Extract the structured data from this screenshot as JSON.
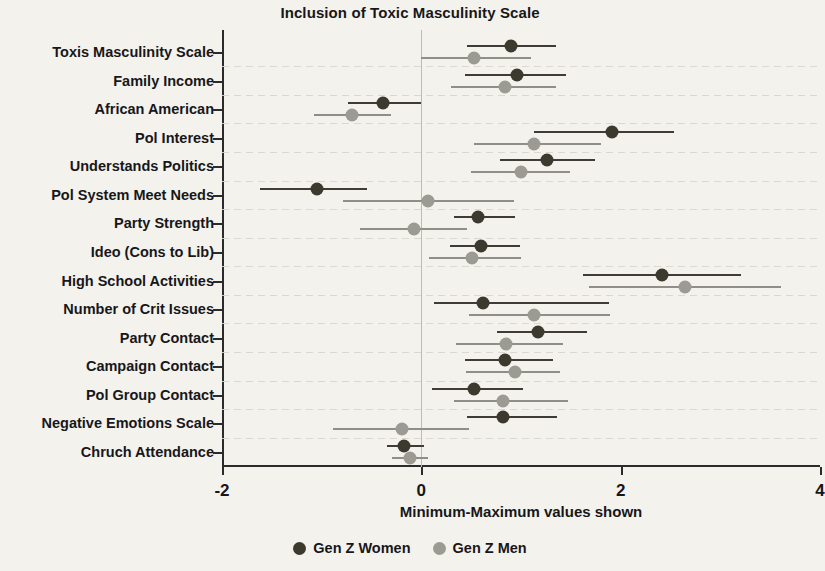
{
  "chart_data": {
    "type": "scatter",
    "title": "Inclusion of Toxic Masculinity Scale",
    "xlabel": "Minimum-Maximum values shown",
    "ylabel": "",
    "xlim": [
      -2,
      4
    ],
    "xticks": [
      -2,
      0,
      2,
      4
    ],
    "xticklabels": [
      "-2",
      "0",
      "2",
      "4"
    ],
    "grid": true,
    "legend_position": "bottom-center",
    "zero_reference_line": 0,
    "categories": [
      "Toxis Masculinity Scale",
      "Family Income",
      "African American",
      "Pol Interest",
      "Understands Politics",
      "Pol System Meet Needs",
      "Party Strength",
      "Ideo (Cons to Lib)",
      "High School Activities",
      "Number of Crit Issues",
      "Party Contact",
      "Campaign Contact",
      "Pol Group Contact",
      "Negative Emotions Scale",
      "Chruch Attendance"
    ],
    "series": [
      {
        "name": "Gen Z Women",
        "color": "#3c392f",
        "values": [
          0.9,
          0.96,
          -0.38,
          1.91,
          1.26,
          -1.05,
          0.57,
          0.6,
          2.41,
          0.62,
          1.17,
          0.84,
          0.53,
          0.82,
          -0.17
        ],
        "low": [
          0.46,
          0.44,
          -0.74,
          1.13,
          0.79,
          -1.62,
          0.33,
          0.29,
          1.62,
          0.13,
          0.76,
          0.44,
          0.11,
          0.46,
          -0.34
        ],
        "high": [
          1.35,
          1.45,
          0.0,
          2.54,
          1.74,
          -0.55,
          0.94,
          0.99,
          3.21,
          1.88,
          1.66,
          1.32,
          1.02,
          1.36,
          0.03
        ]
      },
      {
        "name": "Gen Z Men",
        "color": "#9b9b93",
        "values": [
          0.53,
          0.84,
          -0.7,
          1.13,
          1.0,
          0.07,
          -0.07,
          0.51,
          2.65,
          1.13,
          0.85,
          0.94,
          0.82,
          -0.19,
          -0.11
        ],
        "low": [
          0.0,
          0.3,
          -1.08,
          0.53,
          0.5,
          -0.79,
          -0.62,
          0.08,
          1.68,
          0.48,
          0.35,
          0.45,
          0.33,
          -0.89,
          -0.29
        ],
        "high": [
          1.1,
          1.35,
          -0.3,
          1.8,
          1.49,
          0.93,
          0.46,
          1.0,
          3.61,
          1.89,
          1.42,
          1.39,
          1.47,
          0.48,
          0.07
        ]
      }
    ]
  },
  "legend": {
    "items": [
      {
        "label": "Gen Z Women",
        "color": "#3c392f"
      },
      {
        "label": "Gen Z Men",
        "color": "#9b9b93"
      }
    ]
  }
}
